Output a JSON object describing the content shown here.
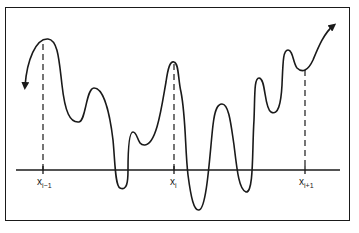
{
  "figure": {
    "stroke_color": "#1a1a1a",
    "background": "#ffffff",
    "labels": [
      {
        "id": "x_prev",
        "base": "x",
        "sub": "i−1",
        "x": 43
      },
      {
        "id": "x_curr",
        "base": "x",
        "sub": "i",
        "x": 174
      },
      {
        "id": "x_next",
        "base": "x",
        "sub": "i+1",
        "x": 305
      }
    ],
    "axis": {
      "y": 170,
      "x_start": 16,
      "x_end": 340
    },
    "curve_description": "Continuous wavy curve with arrowheads at both ends (left end pointing down-left, right end pointing up-right); dashed vertical drop-lines from the curve to the axis at x_{i-1}, x_i and x_{i+1}"
  }
}
